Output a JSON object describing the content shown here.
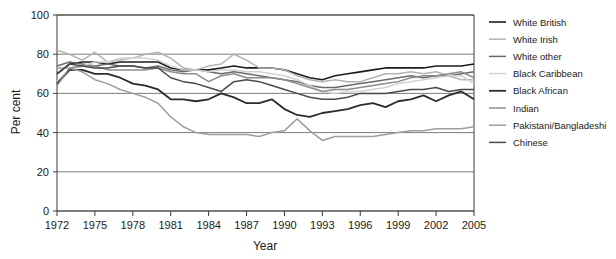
{
  "chart_data": {
    "type": "line",
    "title": "",
    "xlabel": "Year",
    "ylabel": "Per cent",
    "xlim": [
      1972,
      2005
    ],
    "ylim": [
      0,
      100
    ],
    "yticks": [
      0,
      20,
      40,
      60,
      80,
      100
    ],
    "ytick_labels": [
      "0",
      "20",
      "40",
      "60",
      "80",
      "100"
    ],
    "xticks": [
      1972,
      1975,
      1978,
      1981,
      1984,
      1987,
      1990,
      1993,
      1996,
      1999,
      2002,
      2005
    ],
    "xtick_labels": [
      "1972",
      "1975",
      "1978",
      "1981",
      "1984",
      "1987",
      "1990",
      "1993",
      "1996",
      "1999",
      "2002",
      "2005"
    ],
    "x": [
      1972,
      1973,
      1974,
      1975,
      1976,
      1977,
      1978,
      1979,
      1980,
      1981,
      1982,
      1983,
      1984,
      1985,
      1986,
      1987,
      1988,
      1989,
      1990,
      1991,
      1992,
      1993,
      1994,
      1995,
      1996,
      1997,
      1998,
      1999,
      2000,
      2001,
      2002,
      2003,
      2004,
      2005
    ],
    "grid": "horizontal",
    "legend_position": "right",
    "series": [
      {
        "name": "White British",
        "color": "#1c1c1c",
        "width": 1.6,
        "values": [
          70,
          75,
          76,
          76,
          75,
          76,
          76,
          76,
          76,
          73,
          72,
          72,
          72,
          73,
          74,
          73,
          73,
          73,
          72,
          70,
          68,
          67,
          69,
          70,
          71,
          72,
          73,
          73,
          73,
          73,
          74,
          74,
          74,
          75
        ]
      },
      {
        "name": "White Irish",
        "color": "#b4b4b4",
        "width": 1.5,
        "values": [
          82,
          80,
          77,
          81,
          76,
          77,
          78,
          80,
          81,
          78,
          73,
          72,
          74,
          75,
          80,
          77,
          73,
          73,
          72,
          69,
          67,
          66,
          67,
          66,
          66,
          68,
          70,
          70,
          71,
          70,
          71,
          69,
          67,
          67
        ]
      },
      {
        "name": "White other",
        "color": "#6a6a6a",
        "width": 1.5,
        "values": [
          74,
          76,
          75,
          74,
          75,
          74,
          74,
          73,
          74,
          72,
          71,
          72,
          71,
          70,
          71,
          70,
          69,
          68,
          67,
          66,
          64,
          63,
          63,
          64,
          65,
          66,
          67,
          68,
          69,
          68,
          69,
          69,
          70,
          71
        ]
      },
      {
        "name": "Black Caribbean",
        "color": "#d2d2d2",
        "width": 1.5,
        "values": [
          66,
          72,
          74,
          76,
          76,
          78,
          78,
          78,
          77,
          74,
          72,
          72,
          71,
          72,
          72,
          71,
          71,
          70,
          69,
          67,
          64,
          61,
          60,
          61,
          61,
          62,
          63,
          65,
          66,
          67,
          68,
          69,
          69,
          65
        ]
      },
      {
        "name": "Black African",
        "color": "#2b2b2b",
        "width": 1.8,
        "values": [
          65,
          72,
          72,
          70,
          70,
          68,
          65,
          64,
          62,
          57,
          57,
          56,
          57,
          60,
          58,
          55,
          55,
          57,
          52,
          49,
          48,
          50,
          51,
          52,
          54,
          55,
          53,
          56,
          57,
          59,
          56,
          59,
          61,
          57
        ]
      },
      {
        "name": "Indian",
        "color": "#8c8c8c",
        "width": 1.5,
        "values": [
          64,
          73,
          74,
          74,
          72,
          72,
          72,
          72,
          73,
          71,
          70,
          70,
          66,
          69,
          70,
          68,
          68,
          68,
          67,
          65,
          63,
          61,
          62,
          62,
          63,
          64,
          65,
          66,
          68,
          69,
          69,
          70,
          71,
          68
        ]
      },
      {
        "name": "Pakistani/Bangladeshi",
        "color": "#9e9e9e",
        "width": 1.5,
        "values": [
          73,
          73,
          71,
          67,
          65,
          62,
          60,
          58,
          55,
          48,
          43,
          40,
          39,
          39,
          39,
          39,
          38,
          40,
          41,
          47,
          41,
          36,
          38,
          38,
          38,
          38,
          39,
          40,
          41,
          41,
          42,
          42,
          42,
          43
        ]
      },
      {
        "name": "Chinese",
        "color": "#4a4a4a",
        "width": 1.5,
        "values": [
          70,
          75,
          74,
          73,
          73,
          74,
          74,
          73,
          73,
          68,
          66,
          65,
          63,
          61,
          66,
          67,
          66,
          64,
          62,
          60,
          58,
          57,
          57,
          58,
          60,
          60,
          60,
          61,
          62,
          62,
          63,
          61,
          62,
          62
        ]
      }
    ]
  },
  "legend": {
    "items": [
      {
        "label": "White British"
      },
      {
        "label": "White Irish"
      },
      {
        "label": "White other"
      },
      {
        "label": "Black Caribbean"
      },
      {
        "label": "Black African"
      },
      {
        "label": "Indian"
      },
      {
        "label": "Pakistani/Bangladeshi"
      },
      {
        "label": "Chinese"
      }
    ]
  }
}
